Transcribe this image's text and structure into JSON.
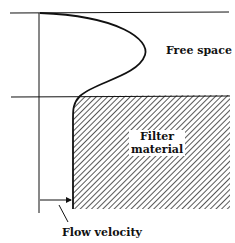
{
  "diagram": {
    "labels": {
      "free_space": "Free space",
      "filter_line1": "Filter",
      "filter_line2": "material",
      "flow_velocity": "Flow velocity"
    },
    "colors": {
      "ink": "#111111",
      "background": "#ffffff"
    },
    "shapes": {
      "top_boundary_y": 13,
      "interface_y": 97,
      "axis_x": 39,
      "velocity_profile": "parabolic in free space, near-constant (Darcy) in filter material",
      "arrow": "flow velocity magnitude from axis to profile"
    }
  }
}
